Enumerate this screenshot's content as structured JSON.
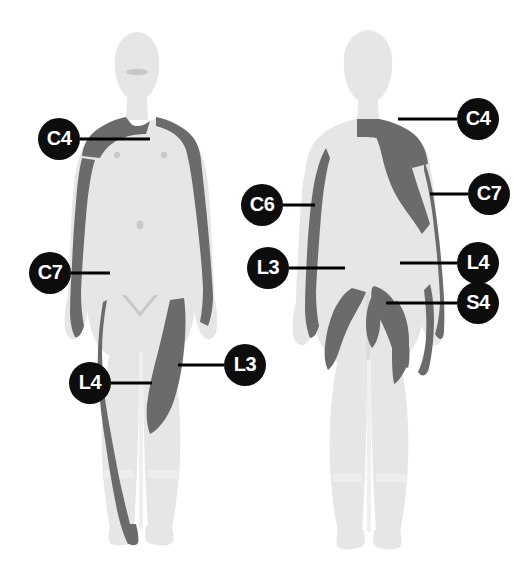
{
  "figure": {
    "views": [
      {
        "name": "anterior-view",
        "label": "Anterior"
      },
      {
        "name": "posterior-view",
        "label": "Posterior"
      }
    ],
    "colors": {
      "background": "#ffffff",
      "body_fill": "#e6e6e6",
      "body_fill_light": "#ececec",
      "dermatome_patch": "#6b6b6b",
      "badge_fill": "#0d0d0d",
      "badge_text": "#ffffff",
      "leader_line": "#000000",
      "feature_detail": "#c9c9c9"
    }
  },
  "labels": [
    {
      "name": "label-c4-anterior",
      "text": "C4",
      "view": "anterior",
      "x": 59,
      "y": 139,
      "line": {
        "x1": 80,
        "y1": 139,
        "x2": 150,
        "y2": 139
      }
    },
    {
      "name": "label-c7-anterior",
      "text": "C7",
      "view": "anterior",
      "x": 50,
      "y": 273,
      "line": {
        "x1": 71,
        "y1": 273,
        "x2": 110,
        "y2": 273
      }
    },
    {
      "name": "label-l4-anterior",
      "text": "L4",
      "view": "anterior",
      "x": 90,
      "y": 383,
      "line": {
        "x1": 111,
        "y1": 383,
        "x2": 152,
        "y2": 383
      }
    },
    {
      "name": "label-l3-anterior",
      "text": "L3",
      "view": "anterior",
      "x": 245,
      "y": 365,
      "line": {
        "x1": 224,
        "y1": 365,
        "x2": 178,
        "y2": 365
      }
    },
    {
      "name": "label-c6-posterior",
      "text": "C6",
      "view": "posterior",
      "x": 262,
      "y": 205,
      "line": {
        "x1": 283,
        "y1": 205,
        "x2": 315,
        "y2": 205
      }
    },
    {
      "name": "label-l3-posterior",
      "text": "L3",
      "view": "posterior",
      "x": 268,
      "y": 268,
      "line": {
        "x1": 289,
        "y1": 268,
        "x2": 345,
        "y2": 268
      }
    },
    {
      "name": "label-c4-posterior",
      "text": "C4",
      "view": "posterior",
      "x": 478,
      "y": 119,
      "line": {
        "x1": 457,
        "y1": 119,
        "x2": 398,
        "y2": 119
      }
    },
    {
      "name": "label-c7-posterior",
      "text": "C7",
      "view": "posterior",
      "x": 489,
      "y": 194,
      "line": {
        "x1": 468,
        "y1": 194,
        "x2": 430,
        "y2": 194
      }
    },
    {
      "name": "label-l4-posterior",
      "text": "L4",
      "view": "posterior",
      "x": 478,
      "y": 263,
      "line": {
        "x1": 457,
        "y1": 263,
        "x2": 400,
        "y2": 263
      }
    },
    {
      "name": "label-s4-posterior",
      "text": "S4",
      "view": "posterior",
      "x": 478,
      "y": 303,
      "line": {
        "x1": 457,
        "y1": 303,
        "x2": 386,
        "y2": 303
      }
    }
  ]
}
